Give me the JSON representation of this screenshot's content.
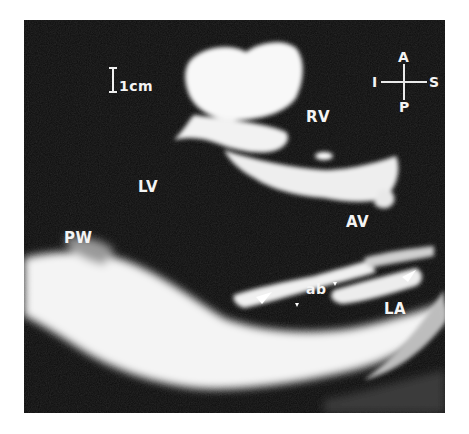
{
  "image": {
    "type": "echocardiogram",
    "view": "parasternal long-axis",
    "colors": {
      "background": "#0b0b0b",
      "tissue": "#f6f6f6",
      "page": "#ffffff",
      "label": "#f4f4f4"
    }
  },
  "scale_bar": {
    "label": "1cm"
  },
  "orientation": {
    "top": "A",
    "bottom": "P",
    "left": "I",
    "right": "S"
  },
  "labels": {
    "rv": "RV",
    "lv": "LV",
    "av": "AV",
    "pw": "PW",
    "ab": "ab",
    "la": "LA"
  }
}
